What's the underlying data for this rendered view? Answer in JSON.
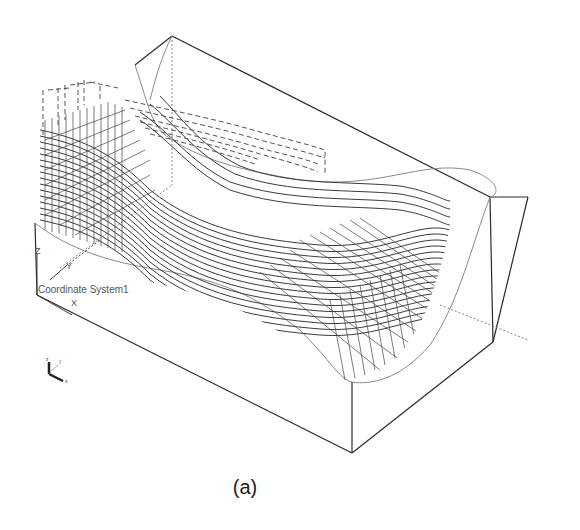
{
  "figure": {
    "caption": "(a)",
    "coordinate_system_label": "Coordinate System1",
    "cs_axis_labels": {
      "x": "X",
      "y": "Y",
      "z": "Z"
    },
    "triad_labels": {
      "x": "x",
      "y": "y",
      "z": "z"
    },
    "colors": {
      "edge": "#2a2a2a",
      "surface_edge": "#8a8a8a",
      "toolpath": "#3a3a3a",
      "hidden": "#666666",
      "background": "#ffffff"
    }
  }
}
